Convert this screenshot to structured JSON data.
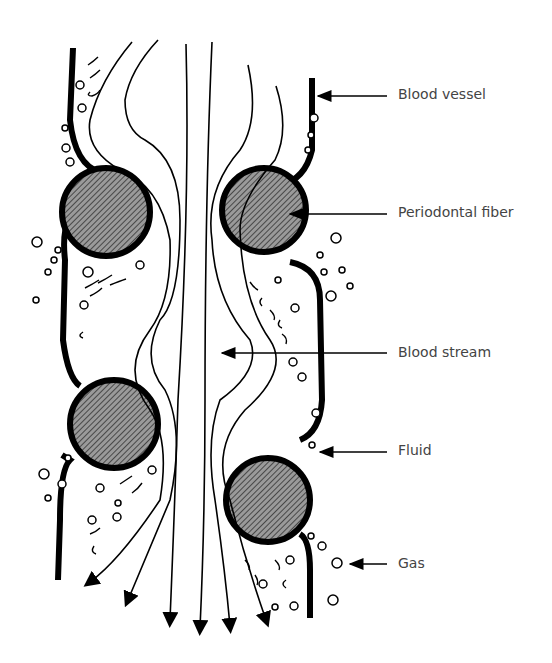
{
  "labels": [
    {
      "id": "blood_vessel",
      "text": "Blood vessel",
      "x": 398,
      "y": 86
    },
    {
      "id": "periodontal_fiber",
      "text": "Periodontal fiber",
      "x": 398,
      "y": 204
    },
    {
      "id": "blood_stream",
      "text": "Blood stream",
      "x": 398,
      "y": 345
    },
    {
      "id": "fluid",
      "text": "Fluid",
      "x": 398,
      "y": 442
    },
    {
      "id": "gas",
      "text": "Gas",
      "x": 398,
      "y": 555
    }
  ]
}
